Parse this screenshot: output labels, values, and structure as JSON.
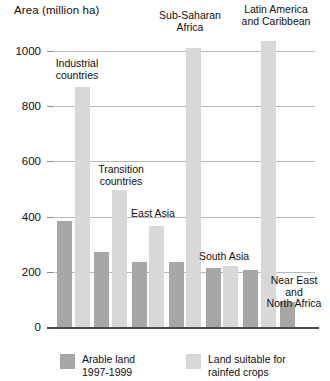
{
  "chart_data": {
    "type": "bar",
    "title": "Area (million ha)",
    "xlabel": "",
    "ylabel": "Area (million ha)",
    "ylim": [
      0,
      1000
    ],
    "yticks": [
      0,
      200,
      400,
      600,
      800,
      1000
    ],
    "ytick_labels": [
      "0",
      "200",
      "400",
      "600",
      "800",
      "1000"
    ],
    "grid": true,
    "legend_position": "bottom",
    "categories": [
      "Industrial countries",
      "Transition countries",
      "East Asia",
      "Sub-Saharan Africa",
      "South Asia",
      "Latin America and Caribbean",
      "Near East and North Africa"
    ],
    "series": [
      {
        "name": "Arable land 1997-1999",
        "color": "#a7a7a7",
        "values": [
          385,
          270,
          235,
          235,
          215,
          205,
          90
        ]
      },
      {
        "name": "Land suitable for rainfed crops",
        "color": "#d8d8d8",
        "values": [
          870,
          495,
          365,
          1010,
          220,
          1035,
          0
        ]
      }
    ]
  },
  "axis": {
    "title": "Area (million ha)",
    "ticks": [
      {
        "label": "1000",
        "value": 1000
      },
      {
        "label": "800",
        "value": 800
      },
      {
        "label": "600",
        "value": 600
      },
      {
        "label": "400",
        "value": 400
      },
      {
        "label": "200",
        "value": 200
      },
      {
        "label": "0",
        "value": 0
      }
    ]
  },
  "group_labels": [
    {
      "text": "Industrial\ncountries",
      "name": "industrial-countries"
    },
    {
      "text": "Transition\ncountries",
      "name": "transition-countries"
    },
    {
      "text": "East Asia",
      "name": "east-asia"
    },
    {
      "text": "Sub-Saharan\nAfrica",
      "name": "sub-saharan-africa"
    },
    {
      "text": "South Asia",
      "name": "south-asia"
    },
    {
      "text": "Latin America\nand Caribbean",
      "name": "latin-america-and-caribbean"
    },
    {
      "text": "Near East\nand\nNorth Africa",
      "name": "near-east-and-north-africa"
    }
  ],
  "legend": {
    "items": [
      {
        "label": "Arable land\n1997-1999",
        "color": "#a7a7a7",
        "name": "arable-land"
      },
      {
        "label": "Land suitable for\nrainfed crops",
        "color": "#d8d8d8",
        "name": "land-suitable-rainfed"
      }
    ]
  }
}
